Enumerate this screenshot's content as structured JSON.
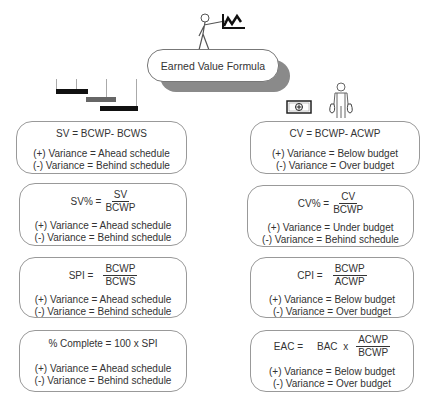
{
  "title": "Earned Value Formula",
  "icons": {
    "presenter": "presenter-with-chart-icon",
    "gantt": "gantt-chart-icon",
    "money": "money-bill-icon",
    "person_bags": "person-with-money-bags-icon"
  },
  "left": [
    {
      "formula_lhs": "SV = BCWP- BCWS",
      "plus": "(+) Variance = Ahead schedule",
      "minus": "(-) Variance = Behind schedule"
    },
    {
      "formula_lhs": "SV% =",
      "num": "SV",
      "den": "BCWP",
      "plus": "(+) Variance = Ahead schedule",
      "minus": "(-) Variance = Behind schedule"
    },
    {
      "formula_lhs": "SPI =",
      "num": "BCWP",
      "den": "BCWS",
      "plus": "(+) Variance = Ahead schedule",
      "minus": "(-) Variance = Behind schedule"
    },
    {
      "formula_lhs": "% Complete = 100 x SPI",
      "plus": "(+) Variance = Ahead schedule",
      "minus": "(-) Variance = Behind schedule"
    }
  ],
  "right": [
    {
      "formula_lhs": "CV = BCWP- ACWP",
      "plus": "(+) Variance = Below budget",
      "minus": "(-) Variance = Over budget"
    },
    {
      "formula_lhs": "CV% =",
      "num": "CV",
      "den": "BCWP",
      "plus": "(+) Variance = Under budget",
      "minus": "(-) Variance = Behind schedule"
    },
    {
      "formula_lhs": "CPI =",
      "num": "BCWP",
      "den": "ACWP",
      "plus": "(+) Variance = Below budget",
      "minus": "(-) Variance = Over budget"
    },
    {
      "formula_lhs": "EAC =",
      "formula_mid": "BAC  x",
      "num": "ACWP",
      "den": "BCWP",
      "plus": "(+) Variance = Below budget",
      "minus": "(-) Variance = Over budget"
    }
  ],
  "colors": {
    "box_border": "#999999",
    "shadow": "#8a8a8a",
    "text": "#333333"
  }
}
